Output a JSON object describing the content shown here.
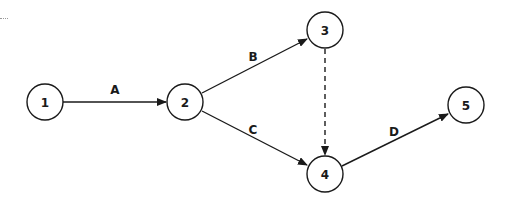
{
  "diagram": {
    "type": "activity-on-arrow network",
    "nodes": [
      {
        "id": "1",
        "label": "1",
        "cx": 45,
        "cy": 102
      },
      {
        "id": "2",
        "label": "2",
        "cx": 185,
        "cy": 102
      },
      {
        "id": "3",
        "label": "3",
        "cx": 325,
        "cy": 30
      },
      {
        "id": "4",
        "label": "4",
        "cx": 325,
        "cy": 174
      },
      {
        "id": "5",
        "label": "5",
        "cx": 466,
        "cy": 105
      }
    ],
    "edges": [
      {
        "from": "1",
        "to": "2",
        "label": "A",
        "style": "solid"
      },
      {
        "from": "2",
        "to": "3",
        "label": "B",
        "style": "solid"
      },
      {
        "from": "2",
        "to": "4",
        "label": "C",
        "style": "solid"
      },
      {
        "from": "3",
        "to": "4",
        "label": "",
        "style": "dashed"
      },
      {
        "from": "4",
        "to": "5",
        "label": "D",
        "style": "solid"
      }
    ],
    "colors": {
      "stroke": "#1a1a1a",
      "background": "#ffffff"
    }
  }
}
